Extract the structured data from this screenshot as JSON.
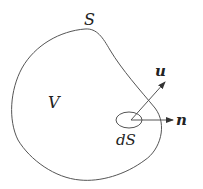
{
  "diagram": {
    "labels": {
      "surface": "S",
      "volume": "V",
      "element": "dS",
      "velocity": "u",
      "normal": "n"
    },
    "colors": {
      "stroke": "#555555",
      "text": "#222222",
      "background": "#ffffff"
    }
  }
}
